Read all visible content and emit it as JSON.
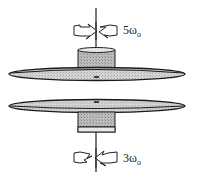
{
  "diagram": {
    "top_disk": {
      "angular_velocity_label": "5ω",
      "angular_velocity_subscript": "o",
      "rotation_direction": "counterclockwise-arrow-right"
    },
    "bottom_disk": {
      "angular_velocity_label": "3ω",
      "angular_velocity_subscript": "o",
      "rotation_direction": "arrow-left"
    },
    "colors": {
      "outline": "#1a1a1a",
      "disk_fill": "#d9d9d9",
      "hub_fill": "#bdbdbd",
      "background": "#ffffff"
    }
  }
}
